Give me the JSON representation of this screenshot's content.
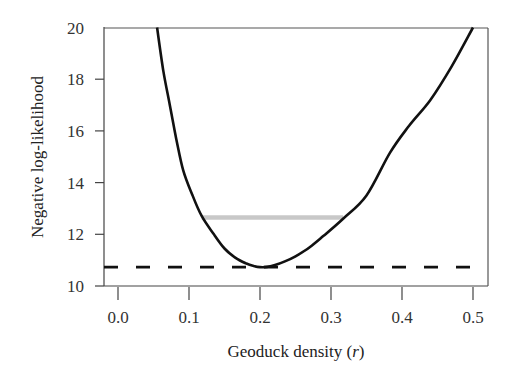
{
  "chart_data": {
    "type": "line",
    "title": "",
    "xlabel": "Geoduck density (r)",
    "xlabel_main": "Geoduck density (",
    "xlabel_var": "r",
    "xlabel_close": ")",
    "ylabel": "Negative log-likelihood",
    "xlim": [
      -0.02,
      0.52
    ],
    "ylim": [
      10,
      20
    ],
    "xticks": [
      0.0,
      0.1,
      0.2,
      0.3,
      0.4,
      0.5
    ],
    "xtick_labels": [
      "0.0",
      "0.1",
      "0.2",
      "0.3",
      "0.4",
      "0.5"
    ],
    "yticks": [
      10,
      12,
      14,
      16,
      18,
      20
    ],
    "ytick_labels": [
      "10",
      "12",
      "14",
      "16",
      "18",
      "20"
    ],
    "grid": false,
    "legend": null,
    "series": [
      {
        "name": "Negative log-likelihood profile",
        "style": "solid",
        "color": "#111111",
        "x": [
          0.055,
          0.064,
          0.073,
          0.082,
          0.092,
          0.105,
          0.118,
          0.135,
          0.15,
          0.165,
          0.18,
          0.19,
          0.2,
          0.21,
          0.22,
          0.235,
          0.25,
          0.27,
          0.29,
          0.317,
          0.35,
          0.383,
          0.41,
          0.44,
          0.47,
          0.5
        ],
        "y": [
          20.0,
          18.3,
          17.0,
          15.7,
          14.46,
          13.5,
          12.7,
          12.0,
          11.45,
          11.1,
          10.88,
          10.78,
          10.73,
          10.74,
          10.8,
          10.95,
          11.15,
          11.5,
          11.95,
          12.6,
          13.5,
          15.15,
          16.2,
          17.2,
          18.5,
          20.0
        ]
      },
      {
        "name": "Minimum NLL",
        "style": "dashed",
        "color": "#111111",
        "x": [
          -0.02,
          0.52
        ],
        "y": [
          10.73,
          10.73
        ]
      },
      {
        "name": "Confidence interval (min + 1.92)",
        "style": "solid-thick",
        "color": "#c8c8c8",
        "x": [
          0.118,
          0.317
        ],
        "y": [
          12.65,
          12.65
        ]
      }
    ]
  }
}
